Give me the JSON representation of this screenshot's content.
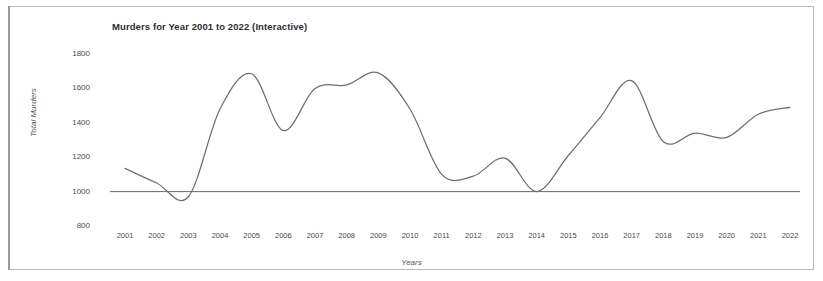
{
  "chart_title": "Murders for Year 2001 to 2022 (Interactive)",
  "axis": {
    "ylabel": "Total Murders",
    "xlabel": "Years"
  },
  "chart_data": {
    "type": "line",
    "title": "Murders for Year 2001 to 2022 (Interactive)",
    "xlabel": "Years",
    "ylabel": "Total Murders",
    "x": [
      2001,
      2002,
      2003,
      2004,
      2005,
      2006,
      2007,
      2008,
      2009,
      2010,
      2011,
      2012,
      2013,
      2014,
      2015,
      2016,
      2017,
      2018,
      2019,
      2020,
      2021,
      2022
    ],
    "xticklabels": [
      "2001",
      "2002",
      "2003",
      "2004",
      "2005",
      "2006",
      "2007",
      "2008",
      "2009",
      "2010",
      "2011",
      "2012",
      "2013",
      "2014",
      "2015",
      "2016",
      "2017",
      "2018",
      "2019",
      "2020",
      "2021",
      "2022"
    ],
    "values": [
      1135,
      1050,
      970,
      1480,
      1685,
      1355,
      1600,
      1620,
      1690,
      1480,
      1100,
      1090,
      1195,
      1000,
      1210,
      1430,
      1645,
      1290,
      1340,
      1315,
      1450,
      1490
    ],
    "series": [
      {
        "name": "Total Murders",
        "values": [
          1135,
          1050,
          970,
          1480,
          1685,
          1355,
          1600,
          1620,
          1690,
          1480,
          1100,
          1090,
          1195,
          1000,
          1210,
          1430,
          1645,
          1290,
          1340,
          1315,
          1450,
          1490
        ],
        "color": "#6f6f6f",
        "interpolation": "smooth"
      }
    ],
    "yticks": [
      800,
      1000,
      1200,
      1400,
      1600,
      1800
    ],
    "yticklabels": [
      "800",
      "1000",
      "1200",
      "1400",
      "1600",
      "1800"
    ],
    "ylim": [
      800,
      1800
    ],
    "xlim": [
      2001,
      2022
    ],
    "grid": false,
    "legend": false,
    "reference_line": {
      "value": 1000,
      "orientation": "horizontal",
      "color": "#6a6a6a"
    }
  },
  "colors": {
    "line": "#6f6f6f",
    "text": "#4a4a4a",
    "title": "#2e2e2e",
    "frame": "#b9b9b9",
    "background": "#ffffff"
  }
}
